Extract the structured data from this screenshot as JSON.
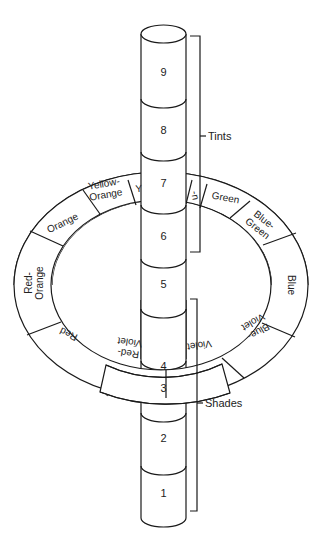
{
  "diagram": {
    "colors": {
      "line": "#1a1a1a",
      "fill": "#ffffff",
      "text": "#222222"
    },
    "tube_segments": [
      {
        "label": "9",
        "y": 72
      },
      {
        "label": "8",
        "y": 130
      },
      {
        "label": "7",
        "y": 183
      },
      {
        "label": "6",
        "y": 236
      },
      {
        "label": "5",
        "y": 284
      },
      {
        "label": "4",
        "y": 334
      },
      {
        "label": "3",
        "y": 388
      },
      {
        "label": "2",
        "y": 438
      },
      {
        "label": "1",
        "y": 493
      }
    ],
    "ring_hues": [
      {
        "label": "Yellow-Orange"
      },
      {
        "label": "Orange"
      },
      {
        "label": "Red-Orange"
      },
      {
        "label": "Red"
      },
      {
        "label": "Red-Violet"
      },
      {
        "label": "Violet"
      },
      {
        "label": "Blue-Violet"
      },
      {
        "label": "Blue"
      },
      {
        "label": "Blue-Green"
      },
      {
        "label": "Green"
      },
      {
        "label": "Yellow-Green"
      },
      {
        "label": "Yellow"
      }
    ],
    "ring_text": {
      "yellow_orange_1": "Yellow-",
      "yellow_orange_2": "Orange",
      "orange": "Orange",
      "red_orange_1": "Red-",
      "red_orange_2": "Orange",
      "red": "Red",
      "red_violet_1": "Red-",
      "red_violet_2": "Violet",
      "violet": "Violet",
      "blue_violet_1": "Blue-",
      "blue_violet_2": "Violet",
      "blue": "Blue",
      "blue_green_1": "Blue-",
      "blue_green_2": "Green",
      "green": "Green",
      "yellow_green_fragment": "-n",
      "yellow_fragment": "Y"
    },
    "brackets": {
      "tints": {
        "label": "Tints",
        "range": [
          "6",
          "9"
        ]
      },
      "shades": {
        "label": "Shades",
        "range": [
          "1",
          "4"
        ]
      }
    }
  }
}
